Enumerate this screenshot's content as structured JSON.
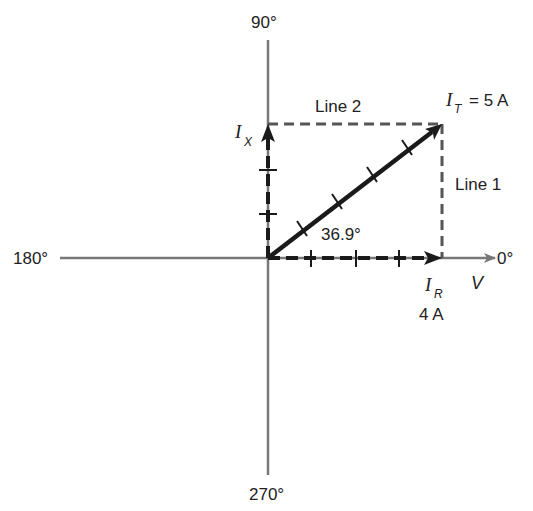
{
  "axes": {
    "label_0": "0°",
    "label_90": "90°",
    "label_180": "180°",
    "label_270": "270°",
    "reference_label": "V"
  },
  "phasors": {
    "total": {
      "symbol": "I",
      "subscript": "T",
      "value_text": "= 5 A",
      "magnitude": 5,
      "angle_deg": 36.9
    },
    "resistive": {
      "symbol": "I",
      "subscript": "R",
      "value_text": "4 A",
      "magnitude": 4,
      "angle_deg": 0
    },
    "reactive": {
      "symbol": "I",
      "subscript": "X",
      "magnitude": 3,
      "angle_deg": 90
    }
  },
  "angle_label": "36.9°",
  "construction_lines": {
    "line1": "Line 1",
    "line2": "Line 2"
  },
  "colors": {
    "axis": "#777777",
    "phasor": "#1a1a1a",
    "dashed": "#555555",
    "text": "#222222"
  }
}
